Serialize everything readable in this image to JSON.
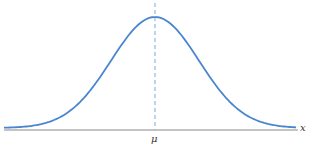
{
  "diagram": {
    "type": "normal-distribution-curve",
    "mean_label": "μ",
    "axis_label": "x",
    "colors": {
      "curve": "#4a86d0",
      "mean_line": "#7aa9dc",
      "axis": "#888888"
    }
  }
}
